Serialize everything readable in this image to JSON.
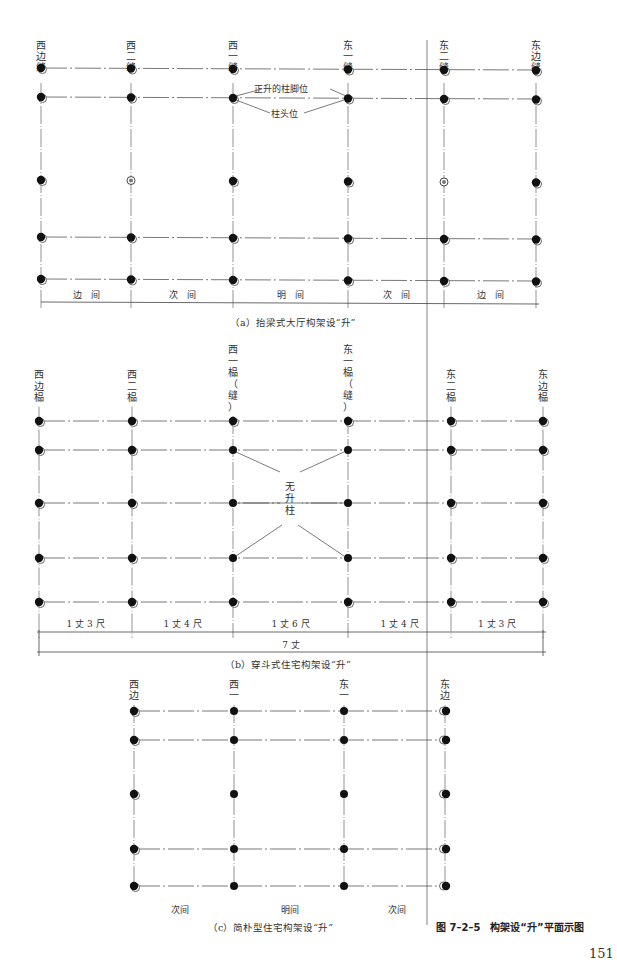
{
  "figure": {
    "title": "图 7–2–5　构架设“升”平面示图",
    "page_number": "151"
  },
  "panel_a": {
    "caption": "（a）抬梁式大厅构架设“升”",
    "columns": [
      {
        "label": [
          "西",
          "边",
          "缝"
        ],
        "x": 41
      },
      {
        "label": [
          "西",
          "二",
          "缝"
        ],
        "x": 131
      },
      {
        "label": [
          "西",
          "一",
          "缝"
        ],
        "x": 233
      },
      {
        "label": [
          "东",
          "一",
          "缝"
        ],
        "x": 348
      },
      {
        "label": [
          "东",
          "二",
          "缝"
        ],
        "x": 444
      },
      {
        "label": [
          "东",
          "边",
          "缝"
        ],
        "x": 536
      }
    ],
    "rows": [
      68,
      97,
      180,
      237,
      279
    ],
    "annotations": {
      "foot": "正升的柱脚位",
      "head": "柱头位"
    },
    "bays": [
      "边　间",
      "次　间",
      "明　间",
      "次　间",
      "边　间"
    ]
  },
  "panel_b": {
    "caption": "（b）穿斗式住宅构架设“升”",
    "columns": [
      {
        "label": [
          "西",
          "边",
          "榀"
        ],
        "x": 39
      },
      {
        "label": [
          "西",
          "二",
          "榀"
        ],
        "x": 132
      },
      {
        "label": [
          "西",
          "一",
          "榀",
          "（",
          "缝",
          "）"
        ],
        "x": 233
      },
      {
        "label": [
          "东",
          "一",
          "榀",
          "（",
          "缝",
          "）"
        ],
        "x": 348
      },
      {
        "label": [
          "东",
          "二",
          "榀"
        ],
        "x": 451
      },
      {
        "label": [
          "东",
          "边",
          "榀"
        ],
        "x": 543
      }
    ],
    "rows": [
      421,
      450,
      503,
      558,
      602
    ],
    "annotation": [
      "无",
      "升",
      "柱"
    ],
    "bays": [
      "1 丈 3 尺",
      "1 丈 4 尺",
      "1 丈 6 尺",
      "1 丈 4 尺",
      "1 丈 3 尺"
    ],
    "total": "7 丈"
  },
  "panel_c": {
    "caption": "（c）简朴型住宅构架设“升”",
    "columns": [
      {
        "label": [
          "西",
          "边"
        ],
        "x": 134
      },
      {
        "label": [
          "西",
          "一"
        ],
        "x": 234
      },
      {
        "label": [
          "东",
          "一"
        ],
        "x": 344
      },
      {
        "label": [
          "东",
          "边"
        ],
        "x": 445
      }
    ],
    "rows": [
      711,
      740,
      794,
      849,
      886
    ],
    "bays": [
      "次间",
      "明间",
      "次间"
    ]
  }
}
